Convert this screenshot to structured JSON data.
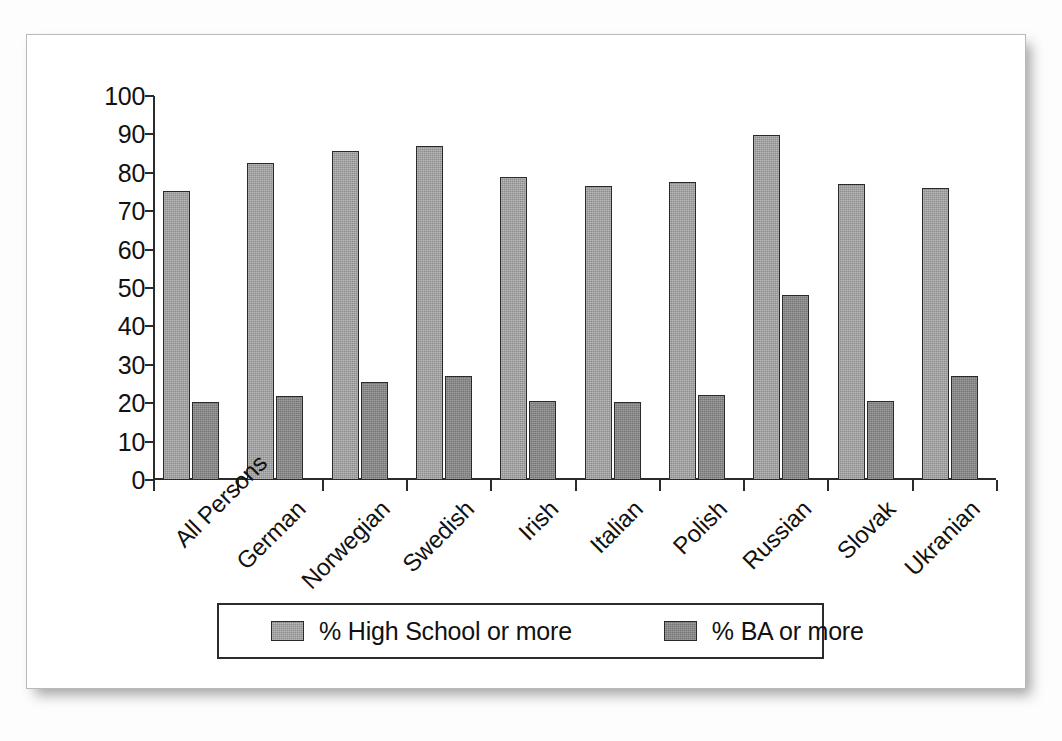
{
  "chart_data": {
    "type": "bar",
    "title": "",
    "subtitle": "",
    "xlabel": "",
    "ylabel": "",
    "ylim": [
      0,
      100
    ],
    "ytick_step": 10,
    "yticks": [
      0,
      10,
      20,
      30,
      40,
      50,
      60,
      70,
      80,
      90,
      100
    ],
    "grid": false,
    "legend_position": "bottom",
    "categories": [
      "All Persons",
      "German",
      "Norwegian",
      "Swedish",
      "Irish",
      "Italian",
      "Polish",
      "Russian",
      "Slovak",
      "Ukranian"
    ],
    "series": [
      {
        "name": "% High School or more",
        "color": "#8d8d8d",
        "values": [
          75.2,
          82.6,
          85.6,
          87.0,
          79.0,
          76.5,
          77.6,
          89.8,
          77.0,
          76.1
        ]
      },
      {
        "name": "% BA or more",
        "color": "#767676",
        "values": [
          20.3,
          21.8,
          25.6,
          27.0,
          20.6,
          20.2,
          22.2,
          48.1,
          20.5,
          27.0
        ]
      }
    ]
  },
  "legend": {
    "entries": [
      {
        "label": "% High School or more",
        "swatch": "hs"
      },
      {
        "label": "% BA or more",
        "swatch": "ba"
      }
    ]
  }
}
